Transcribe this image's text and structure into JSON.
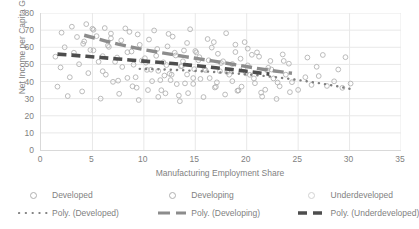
{
  "chart_data": {
    "type": "scatter",
    "title": "",
    "xlabel": "Manufacturing Employment Share",
    "ylabel": "Net Income per Capita Gini",
    "xlim": [
      0,
      35
    ],
    "ylim": [
      0,
      80
    ],
    "xticks": [
      "0",
      "5",
      "10",
      "15",
      "20",
      "25",
      "30",
      "35"
    ],
    "yticks": [
      "0",
      "10",
      "20",
      "30",
      "40",
      "50",
      "60",
      "70",
      "80"
    ],
    "grid": "both-light",
    "legend_position": "bottom",
    "colors": {
      "marker_outline": "#b3b3b3",
      "poly_developed": "#808080",
      "poly_developing": "#8c8c8c",
      "poly_underdeveloped": "#4d4d4d",
      "gridline": "#e8e8e8",
      "axis": "#d9d9d9",
      "text": "#7f7f7f"
    },
    "series": [
      {
        "name": "Developed",
        "marker": "open-circle",
        "points": [
          [
            10.2,
            51.0
          ],
          [
            11.4,
            46.2
          ],
          [
            12.0,
            43.5
          ],
          [
            12.6,
            40.8
          ],
          [
            13.1,
            55.2
          ],
          [
            13.7,
            49.0
          ],
          [
            14.2,
            44.1
          ],
          [
            14.8,
            38.6
          ],
          [
            15.3,
            52.4
          ],
          [
            15.9,
            47.3
          ],
          [
            16.4,
            42.0
          ],
          [
            17.0,
            36.9
          ],
          [
            17.5,
            50.8
          ],
          [
            18.1,
            45.5
          ],
          [
            18.6,
            40.2
          ],
          [
            19.2,
            34.8
          ],
          [
            19.7,
            48.1
          ],
          [
            20.3,
            43.9
          ],
          [
            20.8,
            39.0
          ],
          [
            21.4,
            33.5
          ],
          [
            22.0,
            46.5
          ],
          [
            22.6,
            41.8
          ],
          [
            23.2,
            37.2
          ],
          [
            23.8,
            44.0
          ],
          [
            24.4,
            39.6
          ],
          [
            25.0,
            35.1
          ],
          [
            25.7,
            42.5
          ],
          [
            26.3,
            38.0
          ],
          [
            27.0,
            43.2
          ],
          [
            27.8,
            37.4
          ],
          [
            28.5,
            40.1
          ],
          [
            29.3,
            36.3
          ],
          [
            30.1,
            38.8
          ],
          [
            21.0,
            57.0
          ],
          [
            23.5,
            55.8
          ],
          [
            25.9,
            54.0
          ],
          [
            27.4,
            55.5
          ],
          [
            29.6,
            54.2
          ],
          [
            18.9,
            61.5
          ],
          [
            20.1,
            59.2
          ],
          [
            16.8,
            63.0
          ],
          [
            22.3,
            52.0
          ],
          [
            24.1,
            50.4
          ],
          [
            26.8,
            48.6
          ],
          [
            28.9,
            47.0
          ],
          [
            12.3,
            60.5
          ],
          [
            13.9,
            58.1
          ],
          [
            15.1,
            57.0
          ],
          [
            17.2,
            56.2
          ],
          [
            19.4,
            53.3
          ]
        ]
      },
      {
        "name": "Developing",
        "marker": "open-circle",
        "points": [
          [
            4.1,
            62.0
          ],
          [
            4.8,
            58.4
          ],
          [
            5.4,
            66.5
          ],
          [
            6.0,
            54.8
          ],
          [
            6.6,
            60.2
          ],
          [
            7.2,
            51.5
          ],
          [
            7.8,
            64.0
          ],
          [
            8.4,
            57.1
          ],
          [
            9.0,
            49.8
          ],
          [
            9.6,
            61.4
          ],
          [
            10.1,
            53.6
          ],
          [
            10.7,
            46.9
          ],
          [
            11.3,
            59.0
          ],
          [
            11.9,
            51.2
          ],
          [
            12.5,
            44.5
          ],
          [
            13.0,
            56.8
          ],
          [
            13.6,
            48.9
          ],
          [
            14.2,
            62.5
          ],
          [
            14.8,
            42.0
          ],
          [
            15.4,
            54.2
          ],
          [
            16.0,
            46.6
          ],
          [
            16.6,
            59.8
          ],
          [
            17.1,
            39.5
          ],
          [
            17.7,
            51.8
          ],
          [
            18.3,
            44.0
          ],
          [
            18.9,
            57.2
          ],
          [
            19.5,
            37.0
          ],
          [
            20.1,
            49.4
          ],
          [
            20.7,
            41.8
          ],
          [
            21.2,
            54.5
          ],
          [
            21.8,
            35.2
          ],
          [
            22.4,
            47.0
          ],
          [
            23.0,
            39.4
          ],
          [
            23.6,
            52.0
          ],
          [
            24.2,
            33.8
          ],
          [
            5.1,
            70.2
          ],
          [
            6.8,
            68.0
          ],
          [
            8.2,
            71.0
          ],
          [
            9.4,
            67.5
          ],
          [
            11.0,
            69.8
          ],
          [
            12.8,
            66.2
          ],
          [
            14.5,
            70.5
          ],
          [
            16.2,
            64.8
          ],
          [
            18.0,
            68.2
          ],
          [
            19.8,
            63.0
          ],
          [
            7.5,
            40.5
          ],
          [
            8.9,
            37.2
          ],
          [
            10.4,
            35.0
          ],
          [
            12.1,
            33.1
          ],
          [
            13.4,
            31.8
          ],
          [
            15.8,
            30.9
          ],
          [
            17.9,
            32.4
          ],
          [
            19.1,
            34.6
          ],
          [
            21.5,
            31.2
          ],
          [
            22.9,
            29.8
          ],
          [
            6.3,
            44.0
          ],
          [
            9.2,
            42.5
          ],
          [
            11.6,
            40.8
          ],
          [
            14.0,
            38.9
          ],
          [
            16.9,
            36.5
          ]
        ]
      },
      {
        "name": "Underdeveloped",
        "marker": "open-circle",
        "points": [
          [
            1.4,
            54.5
          ],
          [
            1.9,
            48.2
          ],
          [
            2.3,
            60.0
          ],
          [
            2.8,
            42.5
          ],
          [
            3.2,
            56.8
          ],
          [
            3.7,
            50.1
          ],
          [
            4.2,
            63.4
          ],
          [
            4.6,
            44.9
          ],
          [
            5.1,
            58.2
          ],
          [
            5.6,
            51.5
          ],
          [
            6.0,
            46.0
          ],
          [
            6.5,
            61.0
          ],
          [
            7.0,
            39.8
          ],
          [
            7.4,
            54.0
          ],
          [
            7.9,
            48.5
          ],
          [
            8.4,
            42.1
          ],
          [
            8.8,
            57.5
          ],
          [
            9.3,
            36.4
          ],
          [
            9.8,
            52.2
          ],
          [
            10.3,
            46.8
          ],
          [
            10.8,
            40.2
          ],
          [
            11.2,
            55.0
          ],
          [
            11.7,
            34.9
          ],
          [
            12.2,
            49.6
          ],
          [
            12.7,
            44.0
          ],
          [
            13.2,
            38.5
          ],
          [
            13.8,
            51.8
          ],
          [
            14.3,
            33.2
          ],
          [
            14.9,
            47.2
          ],
          [
            15.5,
            41.5
          ],
          [
            2.0,
            68.5
          ],
          [
            3.5,
            66.0
          ],
          [
            5.0,
            70.8
          ],
          [
            6.8,
            65.2
          ],
          [
            8.6,
            69.0
          ],
          [
            10.5,
            64.5
          ],
          [
            12.4,
            67.8
          ],
          [
            1.6,
            37.0
          ],
          [
            2.6,
            31.5
          ],
          [
            4.0,
            34.2
          ],
          [
            5.8,
            30.0
          ],
          [
            7.6,
            32.8
          ],
          [
            9.5,
            29.2
          ],
          [
            11.4,
            31.0
          ],
          [
            13.5,
            28.5
          ],
          [
            15.0,
            57.8
          ],
          [
            16.3,
            52.4
          ],
          [
            17.4,
            46.0
          ],
          [
            18.6,
            50.2
          ],
          [
            19.9,
            44.8
          ],
          [
            3.0,
            72.0
          ],
          [
            4.4,
            73.5
          ],
          [
            6.2,
            71.2
          ],
          [
            20.5,
            55.6
          ],
          [
            22.1,
            48.0
          ]
        ]
      }
    ],
    "trendlines": [
      {
        "name": "Poly. (Developed)",
        "style": "dotted",
        "color": "#808080",
        "width": 2.4,
        "x_start": 9.6,
        "x_end": 30.3,
        "coeffs_desc": "gentle downward curve",
        "points": [
          [
            9.6,
            47.4
          ],
          [
            11.0,
            47.2
          ],
          [
            12.5,
            46.9
          ],
          [
            14.0,
            46.5
          ],
          [
            15.5,
            46.0
          ],
          [
            17.0,
            45.5
          ],
          [
            18.5,
            44.9
          ],
          [
            20.0,
            44.2
          ],
          [
            21.5,
            43.4
          ],
          [
            23.0,
            42.4
          ],
          [
            24.5,
            41.3
          ],
          [
            26.0,
            40.0
          ],
          [
            27.5,
            38.6
          ],
          [
            29.0,
            37.0
          ],
          [
            30.3,
            35.4
          ]
        ]
      },
      {
        "name": "Poly. (Developing)",
        "style": "dashed",
        "color": "#8c8c8c",
        "width": 3.4,
        "x_start": 4.2,
        "x_end": 24.4,
        "points": [
          [
            4.2,
            67.0
          ],
          [
            5.2,
            65.4
          ],
          [
            6.3,
            63.6
          ],
          [
            7.5,
            61.8
          ],
          [
            8.8,
            60.1
          ],
          [
            10.1,
            58.5
          ],
          [
            11.4,
            57.1
          ],
          [
            12.7,
            55.8
          ],
          [
            14.0,
            54.5
          ],
          [
            15.4,
            53.2
          ],
          [
            16.8,
            51.9
          ],
          [
            18.2,
            50.5
          ],
          [
            19.6,
            49.1
          ],
          [
            21.0,
            47.7
          ],
          [
            22.5,
            46.3
          ],
          [
            24.4,
            44.8
          ]
        ]
      },
      {
        "name": "Poly. (Underdeveloped)",
        "style": "dashed",
        "color": "#4d4d4d",
        "width": 3.6,
        "x_start": 1.6,
        "x_end": 22.2,
        "points": [
          [
            1.6,
            56.0
          ],
          [
            3.0,
            55.4
          ],
          [
            4.4,
            54.7
          ],
          [
            5.8,
            54.0
          ],
          [
            7.2,
            53.3
          ],
          [
            8.6,
            52.6
          ],
          [
            10.0,
            51.9
          ],
          [
            11.4,
            51.2
          ],
          [
            12.8,
            50.5
          ],
          [
            14.2,
            49.7
          ],
          [
            15.6,
            48.9
          ],
          [
            17.0,
            48.0
          ],
          [
            18.4,
            47.1
          ],
          [
            19.8,
            46.1
          ],
          [
            21.0,
            45.2
          ],
          [
            22.2,
            44.3
          ]
        ]
      }
    ]
  },
  "legend": {
    "items": [
      {
        "label": "Developed",
        "key": "open-circle-marker"
      },
      {
        "label": "Developing",
        "key": "open-circle-marker"
      },
      {
        "label": "Underdeveloped",
        "key": "open-circle-marker"
      },
      {
        "label": "Poly. (Developed)",
        "key": "dotted-line-key"
      },
      {
        "label": "Poly. (Developing)",
        "key": "dashed-line-key"
      },
      {
        "label": "Poly. (Underdeveloped)",
        "key": "dashed-line-key"
      }
    ]
  }
}
